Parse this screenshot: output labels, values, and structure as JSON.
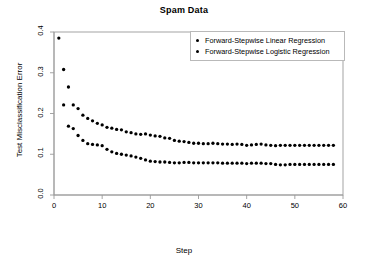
{
  "chart_data": {
    "type": "scatter",
    "title": "Spam Data",
    "xlabel": "Step",
    "ylabel": "Test Misclassification Error",
    "xlim": [
      0,
      60
    ],
    "ylim": [
      0.0,
      0.4
    ],
    "xticks": [
      0,
      10,
      20,
      30,
      40,
      50,
      60
    ],
    "yticks": [
      "0.0",
      "0.1",
      "0.2",
      "0.3",
      "0.4"
    ],
    "grid": false,
    "legend_position": "top-right",
    "marker": "filled-circle",
    "marker_color": "#000000",
    "series": [
      {
        "name": "Forward-Stepwise Linear Regression",
        "x": [
          1,
          2,
          3,
          4,
          5,
          6,
          7,
          8,
          9,
          10,
          11,
          12,
          13,
          14,
          15,
          16,
          17,
          18,
          19,
          20,
          21,
          22,
          23,
          24,
          25,
          26,
          27,
          28,
          29,
          30,
          31,
          32,
          33,
          34,
          35,
          36,
          37,
          38,
          39,
          40,
          41,
          42,
          43,
          44,
          45,
          46,
          47,
          48,
          49,
          50,
          51,
          52,
          53,
          54,
          55,
          56,
          57,
          58
        ],
        "y": [
          0.385,
          0.308,
          0.265,
          0.221,
          0.212,
          0.196,
          0.188,
          0.182,
          0.176,
          0.172,
          0.166,
          0.164,
          0.161,
          0.16,
          0.155,
          0.153,
          0.15,
          0.149,
          0.15,
          0.147,
          0.145,
          0.144,
          0.14,
          0.139,
          0.134,
          0.132,
          0.131,
          0.129,
          0.127,
          0.127,
          0.126,
          0.126,
          0.127,
          0.126,
          0.125,
          0.125,
          0.124,
          0.125,
          0.124,
          0.122,
          0.123,
          0.124,
          0.125,
          0.123,
          0.122,
          0.121,
          0.122,
          0.122,
          0.122,
          0.122,
          0.122,
          0.122,
          0.122,
          0.122,
          0.122,
          0.122,
          0.122,
          0.122
        ]
      },
      {
        "name": "Forward-Stepwise Logistic Regression",
        "x": [
          2,
          3,
          4,
          5,
          6,
          7,
          8,
          9,
          10,
          11,
          12,
          13,
          14,
          15,
          16,
          17,
          18,
          19,
          20,
          21,
          22,
          23,
          24,
          25,
          26,
          27,
          28,
          29,
          30,
          31,
          32,
          33,
          34,
          35,
          36,
          37,
          38,
          39,
          40,
          41,
          42,
          43,
          44,
          45,
          46,
          47,
          48,
          49,
          50,
          51,
          52,
          53,
          54,
          55,
          56,
          57,
          58
        ],
        "y": [
          0.221,
          0.169,
          0.163,
          0.146,
          0.134,
          0.126,
          0.124,
          0.123,
          0.121,
          0.112,
          0.106,
          0.102,
          0.1,
          0.098,
          0.096,
          0.093,
          0.09,
          0.086,
          0.083,
          0.082,
          0.081,
          0.081,
          0.08,
          0.079,
          0.079,
          0.08,
          0.08,
          0.079,
          0.079,
          0.079,
          0.079,
          0.079,
          0.079,
          0.078,
          0.078,
          0.078,
          0.078,
          0.078,
          0.077,
          0.078,
          0.078,
          0.078,
          0.077,
          0.077,
          0.075,
          0.074,
          0.074,
          0.075,
          0.075,
          0.075,
          0.075,
          0.075,
          0.075,
          0.075,
          0.075,
          0.075,
          0.075
        ]
      }
    ]
  },
  "legend": {
    "entries": [
      "Forward-Stepwise Linear Regression",
      "Forward-Stepwise Logistic Regression"
    ]
  }
}
